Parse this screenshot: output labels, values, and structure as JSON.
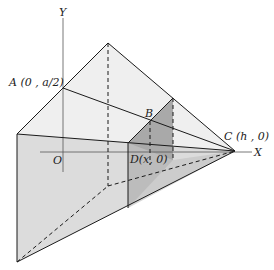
{
  "diagram": {
    "axes": {
      "x_label": "X",
      "y_label": "Y",
      "origin_label": "O"
    },
    "points": {
      "A": "A (0 , a/2)",
      "B": "B",
      "C": "C (h , 0)",
      "D": "D(x, 0)"
    },
    "colors": {
      "line": "#1a1a1a",
      "face_light": "#ececec",
      "face_mid": "#d9d9d9",
      "section": "#a8a8a8",
      "section_dark": "#9a9a9a"
    }
  }
}
